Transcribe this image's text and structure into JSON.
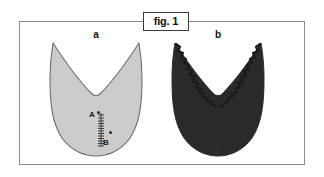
{
  "figure": {
    "caption_label": "fig. 1",
    "panels": [
      {
        "id": "a",
        "label": "a",
        "fill_color": "#cccccc",
        "stroke_color": "#6e6e6e",
        "edge_style": "smooth",
        "description": "light gray outlined U-shaped form with central V notch"
      },
      {
        "id": "b",
        "label": "b",
        "fill_color": "#2a2a2a",
        "stroke_color": "#2a2a2a",
        "edge_style": "serrated",
        "description": "dark filled U-shaped form with serrated zigzag notch edges"
      }
    ],
    "annotations": {
      "point_a_label": "A",
      "point_b_label": "B",
      "scale_marks": 14
    },
    "frame_color": "#8a8a8a",
    "background_color": "#ffffff"
  }
}
